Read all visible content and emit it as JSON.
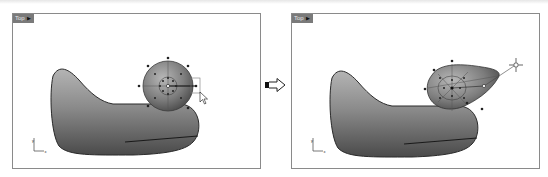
{
  "figure": {
    "colors": {
      "viewport_border": "#8a8a8a",
      "viewport_label_bg": "#7a7a7a",
      "surface_dark": "#3a3a3a",
      "surface_mid": "#8f8f8f",
      "surface_light": "#c9c9c9",
      "control_point": "#222222"
    }
  },
  "viewports": [
    {
      "id": "before",
      "label": "Top",
      "label_menu_icon": "dropdown-caret",
      "axis": {
        "x_label": "x",
        "y_label": "y"
      },
      "state": "sphere head with control points; cursor dragging right-side point"
    },
    {
      "id": "after",
      "label": "Top",
      "label_menu_icon": "dropdown-caret",
      "axis": {
        "x_label": "x",
        "y_label": "y"
      },
      "state": "head stretched into beak toward upper right; move gumball at tip"
    }
  ],
  "transition": {
    "icon": "right-arrow-icon"
  }
}
